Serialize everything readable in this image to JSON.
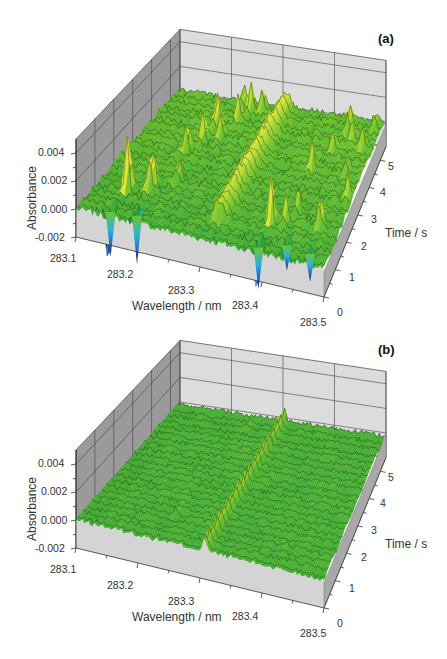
{
  "chart_data": [
    {
      "type": "surface3d",
      "panel_label": "(a)",
      "xlabel": "Wavelength / nm",
      "ylabel": "Time / s",
      "zlabel": "Absorbance",
      "x_ticks": [
        "283.1",
        "283.2",
        "283.3",
        "283.4",
        "283.5"
      ],
      "y_ticks": [
        "0",
        "1",
        "2",
        "3",
        "4",
        "5"
      ],
      "z_ticks": [
        "0.004",
        "0.002",
        "0.000",
        "-0.002"
      ],
      "xlim": [
        283.1,
        283.5
      ],
      "ylim": [
        0,
        5.5
      ],
      "zlim": [
        -0.002,
        0.005
      ],
      "grid": true,
      "colormap": [
        "#1a1464",
        "#1f5fc4",
        "#2bb3d9",
        "#1e9a3c",
        "#6fc22a",
        "#d8e83a",
        "#f5d21e",
        "#f08a1a",
        "#d8261c"
      ],
      "description": "Uncorrected time-resolved absorbance spectrum with many intense positive spikes (up to ~0.0045) and negative dips (to ~-0.003), plus a broad analyte ridge near 283.31 nm",
      "baseline_noise": 0.00025,
      "features": [
        {
          "kind": "spike",
          "x": 283.15,
          "t": 1.2,
          "z": 0.0048
        },
        {
          "kind": "dip",
          "x": 283.15,
          "t": 0.2,
          "z": -0.0032
        },
        {
          "kind": "spike",
          "x": 283.18,
          "t": 1.5,
          "z": 0.0038
        },
        {
          "kind": "spike",
          "x": 283.17,
          "t": 1.8,
          "z": 0.0014
        },
        {
          "kind": "dip",
          "x": 283.19,
          "t": 0.3,
          "z": -0.0035
        },
        {
          "kind": "spike",
          "x": 283.21,
          "t": 2.0,
          "z": 0.0016
        },
        {
          "kind": "spike",
          "x": 283.19,
          "t": 3.2,
          "z": 0.0022
        },
        {
          "kind": "spike",
          "x": 283.21,
          "t": 4.3,
          "z": 0.0024
        },
        {
          "kind": "spike",
          "x": 283.23,
          "t": 3.9,
          "z": 0.0018
        },
        {
          "kind": "spike",
          "x": 283.24,
          "t": 4.6,
          "z": 0.0022
        },
        {
          "kind": "spike",
          "x": 283.25,
          "t": 5.1,
          "z": 0.002
        },
        {
          "kind": "spike",
          "x": 283.23,
          "t": 5.3,
          "z": 0.0016
        },
        {
          "kind": "spike",
          "x": 283.27,
          "t": 5.2,
          "z": 0.0018
        },
        {
          "kind": "spike",
          "x": 283.205,
          "t": 3.6,
          "z": 0.0022
        },
        {
          "kind": "spike",
          "x": 283.39,
          "t": 1.2,
          "z": 0.0042
        },
        {
          "kind": "dip",
          "x": 283.39,
          "t": 0.2,
          "z": -0.003
        },
        {
          "kind": "spike",
          "x": 283.41,
          "t": 1.3,
          "z": 0.002
        },
        {
          "kind": "spike",
          "x": 283.42,
          "t": 1.8,
          "z": 0.0016
        },
        {
          "kind": "dip",
          "x": 283.43,
          "t": 0.5,
          "z": -0.0018
        },
        {
          "kind": "spike",
          "x": 283.465,
          "t": 1.5,
          "z": 0.0026
        },
        {
          "kind": "dip",
          "x": 283.47,
          "t": 0.4,
          "z": -0.002
        },
        {
          "kind": "spike",
          "x": 283.41,
          "t": 3.4,
          "z": 0.002
        },
        {
          "kind": "spike",
          "x": 283.43,
          "t": 4.2,
          "z": 0.0018
        },
        {
          "kind": "spike",
          "x": 283.44,
          "t": 5.0,
          "z": 0.0022
        },
        {
          "kind": "spike",
          "x": 283.455,
          "t": 4.6,
          "z": 0.0016
        },
        {
          "kind": "spike",
          "x": 283.47,
          "t": 3.5,
          "z": 0.0012
        },
        {
          "kind": "spike",
          "x": 283.48,
          "t": 4.4,
          "z": 0.0014
        },
        {
          "kind": "spike",
          "x": 283.49,
          "t": 2.6,
          "z": 0.0016
        },
        {
          "kind": "spike",
          "x": 283.485,
          "t": 5.2,
          "z": 0.0012
        },
        {
          "kind": "ridge",
          "x": 283.31,
          "t0": 0.8,
          "t1": 5.5,
          "z": 0.0012,
          "width": 0.012
        }
      ],
      "row_offsets": [
        0,
        0.0004,
        0.0002,
        0.0006,
        0.0003,
        0.0007,
        0.0004,
        0.0008,
        0.0005,
        0.0009,
        0.0006,
        0.001,
        0.0007,
        0.0011,
        0.0008,
        0.0012,
        0.0009,
        0.0013,
        0.001,
        0.0012,
        0.0011,
        0.001
      ]
    },
    {
      "type": "surface3d",
      "panel_label": "(b)",
      "xlabel": "Wavelength / nm",
      "ylabel": "Time / s",
      "zlabel": "Absorbance",
      "x_ticks": [
        "283.1",
        "283.2",
        "283.3",
        "283.4",
        "283.5"
      ],
      "y_ticks": [
        "0",
        "1",
        "2",
        "3",
        "4",
        "5"
      ],
      "z_ticks": [
        "0.004",
        "0.002",
        "0.000",
        "-0.002"
      ],
      "xlim": [
        283.1,
        283.5
      ],
      "ylim": [
        0,
        5.5
      ],
      "zlim": [
        -0.002,
        0.005
      ],
      "grid": true,
      "colormap": [
        "#1a1464",
        "#1f5fc4",
        "#2bb3d9",
        "#1e9a3c",
        "#6fc22a",
        "#d8e83a",
        "#f5d21e",
        "#f08a1a",
        "#d8261c"
      ],
      "description": "Corrected spectrum: flat green noisy baseline near 0 with a single narrow analyte ridge near 283.31 nm running across all times",
      "baseline_noise": 0.00018,
      "features": [
        {
          "kind": "ridge",
          "x": 283.307,
          "t0": 0.0,
          "t1": 5.5,
          "z": 0.0009,
          "width": 0.004
        },
        {
          "kind": "spike",
          "x": 283.25,
          "t": 5.0,
          "z": 0.0005
        },
        {
          "kind": "spike",
          "x": 283.23,
          "t": 1.2,
          "z": 0.0005
        },
        {
          "kind": "spike",
          "x": 283.42,
          "t": 0.8,
          "z": 0.0004
        }
      ],
      "row_offsets": [
        0,
        0.0001,
        0,
        0.0001,
        0,
        0.0001,
        0,
        0.0001,
        0,
        0.0001,
        0,
        0.0001,
        0,
        0.0001,
        0,
        0.0001,
        0,
        0.0001,
        0,
        0.0001,
        0,
        0.0001
      ]
    }
  ]
}
